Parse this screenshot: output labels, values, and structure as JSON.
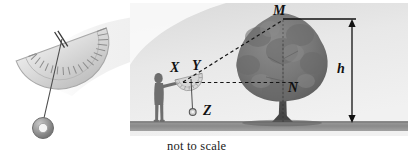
{
  "figure": {
    "caption": "not to scale",
    "left_panel": {
      "name": "protractor-clinometer",
      "description": "semicircular protractor with plumb line and ring weight",
      "parts": [
        "protractor-body",
        "protractor-scale-ticks",
        "plumb-string",
        "ring-weight",
        "pivot-marks"
      ]
    },
    "scene": {
      "name": "tree-height-measurement-scene",
      "ground_label": "ground",
      "elements": [
        "observer-person",
        "handheld-clinometer",
        "tree",
        "sight-line",
        "horizontal-line",
        "height-dimension"
      ]
    },
    "labels": {
      "x": "X",
      "y": "Y",
      "z": "Z",
      "m": "M",
      "n": "N",
      "h": "h"
    },
    "colors": {
      "sky": "#e9e9e9",
      "ground": "#8e8e8e",
      "tree_foliage": "#6f6f6f",
      "tree_trunk": "#4a4a4a",
      "line": "#1a1a1a",
      "person": "#6b6b6b",
      "protractor": "#d4d4d4"
    }
  }
}
